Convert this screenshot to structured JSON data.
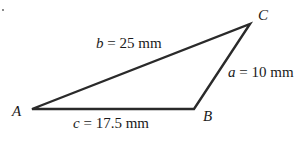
{
  "diagram": {
    "type": "triangle",
    "vertices": {
      "A": {
        "label": "A",
        "x": 32,
        "y": 109
      },
      "B": {
        "label": "B",
        "x": 194,
        "y": 109
      },
      "C": {
        "label": "C",
        "x": 250,
        "y": 24
      }
    },
    "sides": {
      "a": {
        "var": "a",
        "eq": " = 10 mm",
        "between": [
          "B",
          "C"
        ]
      },
      "b": {
        "var": "b",
        "eq": " = 25 mm",
        "between": [
          "A",
          "C"
        ]
      },
      "c": {
        "var": "c",
        "eq": " = 17.5 mm",
        "between": [
          "A",
          "B"
        ]
      }
    },
    "stroke_color": "#2a2a2a"
  }
}
